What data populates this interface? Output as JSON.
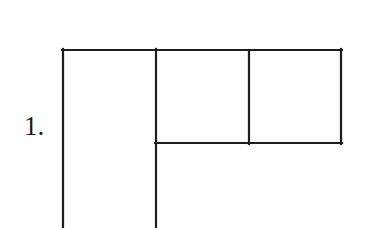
{
  "page": {
    "width": 377,
    "height": 228,
    "background_color": "#fefefe",
    "ink_color": "#1d1d1d"
  },
  "item": {
    "number_label": "1.",
    "number_label_x": 24,
    "number_label_y": 110
  },
  "figure": {
    "name": "rectangle-partition-diagram",
    "stroke_color": "#1d1d1d",
    "stroke_width": 2.2,
    "frame": {
      "left": 63,
      "top": 50,
      "right": 341,
      "divider_y": 143,
      "bottom_cropped_at": 228
    },
    "segments": [
      {
        "name": "top-edge",
        "x1": 62,
        "y1": 50,
        "x2": 342,
        "y2": 50
      },
      {
        "name": "left-vertical-edge",
        "x1": 63,
        "y1": 49,
        "x2": 63,
        "y2": 228
      },
      {
        "name": "middle-vertical-line",
        "x1": 156,
        "y1": 49,
        "x2": 156,
        "y2": 228
      },
      {
        "name": "inner-vertical-divider",
        "x1": 249,
        "y1": 50,
        "x2": 249,
        "y2": 144
      },
      {
        "name": "right-vertical-edge",
        "x1": 341,
        "y1": 49,
        "x2": 341,
        "y2": 144
      },
      {
        "name": "horizontal-divider",
        "x1": 155,
        "y1": 143,
        "x2": 342,
        "y2": 143
      }
    ],
    "cells": [
      {
        "name": "left-tall-column",
        "x": 63,
        "y": 50,
        "width": 93,
        "height": 178,
        "open_bottom": true
      },
      {
        "name": "upper-middle-cell",
        "x": 156,
        "y": 50,
        "width": 93,
        "height": 93,
        "open_bottom": false
      },
      {
        "name": "upper-right-cell",
        "x": 249,
        "y": 50,
        "width": 92,
        "height": 93,
        "open_bottom": false
      }
    ]
  }
}
